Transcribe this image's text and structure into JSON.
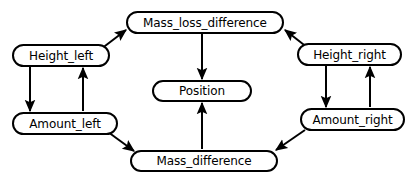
{
  "diagram": {
    "type": "directed-graph",
    "background_color": "#ffffff",
    "stroke_color": "#000000",
    "text_color": "#000000",
    "nodes": [
      {
        "id": "mass_loss_difference",
        "label": "Mass_loss_difference",
        "x": 126,
        "y": 11,
        "w": 158,
        "h": 23
      },
      {
        "id": "height_left",
        "label": "Height_left",
        "x": 12,
        "y": 44,
        "w": 98,
        "h": 23
      },
      {
        "id": "height_right",
        "label": "Height_right",
        "x": 297,
        "y": 43,
        "w": 105,
        "h": 23
      },
      {
        "id": "position",
        "label": "Position",
        "x": 152,
        "y": 80,
        "w": 100,
        "h": 22
      },
      {
        "id": "amount_left",
        "label": "Amount_left",
        "x": 12,
        "y": 112,
        "w": 106,
        "h": 23
      },
      {
        "id": "amount_right",
        "label": "Amount_right",
        "x": 300,
        "y": 108,
        "w": 105,
        "h": 23
      },
      {
        "id": "mass_difference",
        "label": "Mass_difference",
        "x": 130,
        "y": 150,
        "w": 148,
        "h": 22
      }
    ],
    "edges": [
      {
        "id": "height_left-to-mass_loss_difference",
        "from": "height_left",
        "to": "mass_loss_difference",
        "x1": 101,
        "y1": 49,
        "x2": 126,
        "y2": 30
      },
      {
        "id": "height_right-to-mass_loss_difference",
        "from": "height_right",
        "to": "mass_loss_difference",
        "x1": 308,
        "y1": 48,
        "x2": 285,
        "y2": 30
      },
      {
        "id": "mass_loss_difference-to-position",
        "from": "mass_loss_difference",
        "to": "position",
        "x1": 202,
        "y1": 34,
        "x2": 202,
        "y2": 79
      },
      {
        "id": "mass_difference-to-position",
        "from": "mass_difference",
        "to": "position",
        "x1": 202,
        "y1": 149,
        "x2": 202,
        "y2": 103
      },
      {
        "id": "height_left-to-amount_left",
        "from": "height_left",
        "to": "amount_left",
        "x1": 30,
        "y1": 67,
        "x2": 30,
        "y2": 111
      },
      {
        "id": "amount_left-to-height_left",
        "from": "amount_left",
        "to": "height_left",
        "x1": 83,
        "y1": 111,
        "x2": 83,
        "y2": 68
      },
      {
        "id": "height_right-to-amount_right",
        "from": "height_right",
        "to": "amount_right",
        "x1": 326,
        "y1": 66,
        "x2": 326,
        "y2": 107
      },
      {
        "id": "amount_right-to-height_right",
        "from": "amount_right",
        "to": "height_right",
        "x1": 370,
        "y1": 107,
        "x2": 370,
        "y2": 67
      },
      {
        "id": "amount_left-to-mass_difference",
        "from": "amount_left",
        "to": "mass_difference",
        "x1": 108,
        "y1": 132,
        "x2": 134,
        "y2": 151
      },
      {
        "id": "amount_right-to-mass_difference",
        "from": "amount_right",
        "to": "mass_difference",
        "x1": 305,
        "y1": 130,
        "x2": 276,
        "y2": 150
      }
    ]
  }
}
